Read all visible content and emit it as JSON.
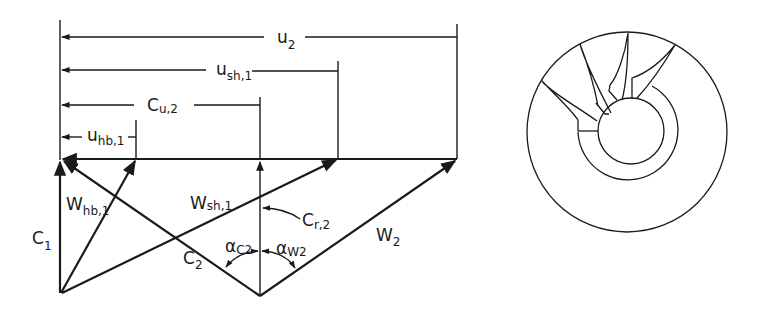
{
  "figure": {
    "velocity_triangle": {
      "dimensions": [
        {
          "id": "u2",
          "main": "u",
          "sub": "2"
        },
        {
          "id": "ush1",
          "main": "u",
          "sub": "sh,1"
        },
        {
          "id": "cu2",
          "main": "C",
          "sub": "u,2"
        },
        {
          "id": "uhb1",
          "main": "u",
          "sub": "hb,1"
        }
      ],
      "vectors": [
        {
          "id": "c1",
          "main": "C",
          "sub": "1"
        },
        {
          "id": "whb1",
          "main": "W",
          "sub": "hb,1"
        },
        {
          "id": "wsh1",
          "main": "W",
          "sub": "sh,1"
        },
        {
          "id": "c2",
          "main": "C",
          "sub": "2"
        },
        {
          "id": "cr2",
          "main": "C",
          "sub": "r,2"
        },
        {
          "id": "w2",
          "main": "W",
          "sub": "2"
        }
      ],
      "angles": [
        {
          "id": "ac2",
          "main": "α",
          "sub": "C2"
        },
        {
          "id": "aw2",
          "main": "α",
          "sub": "W2"
        }
      ]
    },
    "impeller_sketch": {
      "description": "Front view of radial-inflow impeller with blades"
    },
    "colors": {
      "ink": "#1a1a1a",
      "background": "#ffffff"
    }
  }
}
